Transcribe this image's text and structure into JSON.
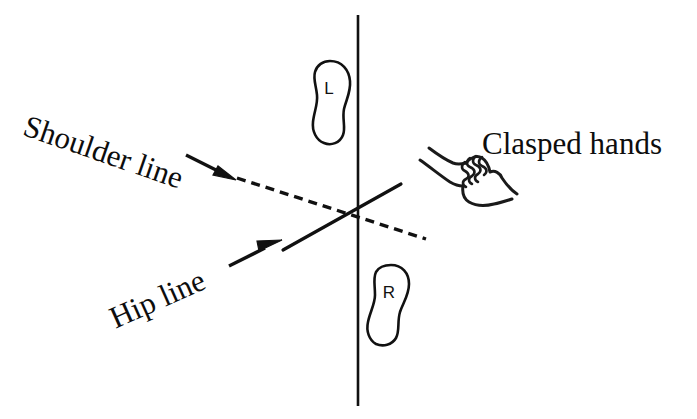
{
  "figure": {
    "title": "",
    "background_color": "#ffffff",
    "ink_color": "#111111",
    "width": 697,
    "height": 419
  },
  "labels": {
    "shoulder_line": "Shoulder line",
    "hip_line": "Hip line",
    "clasped_hands": "Clasped hands"
  },
  "feet": {
    "left": {
      "letter": "L",
      "name": "left-foot-outline"
    },
    "right": {
      "letter": "R",
      "name": "right-foot-outline"
    }
  },
  "elements": {
    "vertical_axis": "vertical-reference-line",
    "shoulder_line_style": "dashed",
    "hip_line_style": "solid",
    "shoulder_arrow": "arrow-pointing-down-right",
    "hip_arrow": "arrow-pointing-up-right",
    "hands_sketch": "clasped-hands-sketch"
  }
}
